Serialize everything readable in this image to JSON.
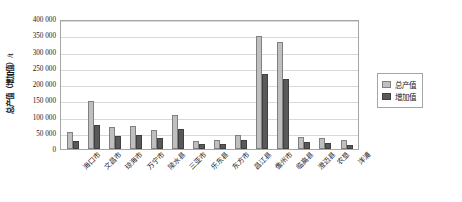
{
  "chart_data": {
    "type": "bar",
    "title": "",
    "xlabel": "",
    "ylabel": "总产值（增加值）/t",
    "ylim": [
      0,
      400000
    ],
    "ytick_labels": [
      "400 000",
      "350 000",
      "300 000",
      "250 000",
      "200 000",
      "150 000",
      "100 000",
      "50 000",
      "0"
    ],
    "ytick_values": [
      400000,
      350000,
      300000,
      250000,
      200000,
      150000,
      100000,
      50000,
      0
    ],
    "grid": true,
    "legend_position": "right-outside",
    "categories": [
      "海口市",
      "文昌市",
      "琼海市",
      "万宁市",
      "陵水县",
      "三亚市",
      "乐东县",
      "东方市",
      "昌江县",
      "儋州市",
      "临高县",
      "澄迈县",
      "农垦",
      "洋浦"
    ],
    "series": [
      {
        "name": "总产值",
        "color": "#bfbfbf",
        "values": [
          52000,
          148000,
          68000,
          72000,
          60000,
          105000,
          25000,
          27000,
          42000,
          348000,
          330000,
          38000,
          35000,
          28000
        ]
      },
      {
        "name": "增加值",
        "color": "#595959",
        "values": [
          25000,
          75000,
          40000,
          42000,
          35000,
          62000,
          14000,
          15000,
          28000,
          230000,
          215000,
          22000,
          20000,
          12000
        ]
      }
    ]
  },
  "legend": {
    "entries": [
      {
        "label": "总产值"
      },
      {
        "label": "增加值"
      }
    ]
  }
}
